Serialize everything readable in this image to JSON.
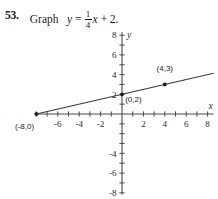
{
  "problem": {
    "number": "53.",
    "instruction": "Graph",
    "equation_lhs": "y",
    "equals": "=",
    "fraction_numerator": "1",
    "fraction_denominator": "4",
    "equation_var": "x",
    "plus": "+",
    "equation_constant": "2",
    "period": "."
  },
  "chart_data": {
    "type": "line",
    "title": "",
    "xlabel": "x",
    "ylabel": "y",
    "xlim": [
      -8,
      8
    ],
    "ylim": [
      -8,
      8
    ],
    "grid": false,
    "legend": "none",
    "x_tick_labels": [
      "-6",
      "-4",
      "-2",
      "2",
      "4",
      "6",
      "8"
    ],
    "x_tick_values": [
      -6,
      -4,
      -2,
      2,
      4,
      6,
      8
    ],
    "y_tick_labels": [
      "8",
      "6",
      "4",
      "2",
      "-4",
      "-6",
      "-8"
    ],
    "y_tick_values": [
      8,
      6,
      4,
      2,
      -4,
      -6,
      -8
    ],
    "x_minor_ticks": [
      -8,
      -7,
      -6,
      -5,
      -4,
      -3,
      -2,
      -1,
      1,
      2,
      3,
      4,
      5,
      6,
      7,
      8
    ],
    "y_minor_ticks": [
      -8,
      -7,
      -6,
      -5,
      -4,
      -3,
      -2,
      -1,
      1,
      2,
      3,
      4,
      5,
      6,
      7,
      8
    ],
    "series": [
      {
        "name": "y = (1/4)x + 2",
        "slope": 0.25,
        "intercept": 2,
        "x": [
          -8,
          8
        ],
        "y": [
          0,
          4
        ]
      }
    ],
    "points": [
      {
        "label": "(-8,0)",
        "x": -8,
        "y": 0,
        "marker": true,
        "label_dx": -2,
        "label_dy": -1.5
      },
      {
        "label": "(0,2)",
        "x": 0,
        "y": 2,
        "marker": true,
        "label_dx": 0.3,
        "label_dy": -0.8
      },
      {
        "label": "(4,3)",
        "x": 4,
        "y": 3,
        "marker": true,
        "label_dx": 0,
        "label_dy": 1.4
      }
    ]
  },
  "axis_labels": {
    "x_axis_name": "x",
    "y_axis_name": "y"
  }
}
